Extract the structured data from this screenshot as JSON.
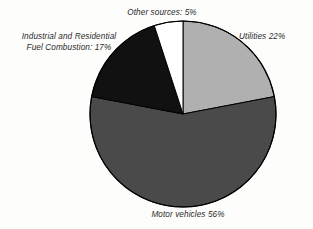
{
  "chart_data": {
    "type": "pie",
    "title": "",
    "legend_position": "none",
    "grid": false,
    "categories": [
      "Utilities",
      "Motor vehicles",
      "Industrial and Residential Fuel Combustion",
      "Other sources"
    ],
    "values": [
      22,
      56,
      17,
      5
    ],
    "unit": "%",
    "slices": [
      {
        "label": "Utilities 22%",
        "category": "Utilities",
        "value": 22,
        "color": "#b0b0b0",
        "start_angle_deg": 0,
        "end_angle_deg": 79.2,
        "label_position": "right"
      },
      {
        "label": "Motor vehicles 56%",
        "category": "Motor vehicles",
        "value": 56,
        "color": "#4a4a4a",
        "start_angle_deg": 79.2,
        "end_angle_deg": 280.8,
        "label_position": "bottom"
      },
      {
        "label": "Industrial and Residential\nFuel Combustion: 17%",
        "category": "Industrial and Residential Fuel Combustion",
        "value": 17,
        "color": "#111111",
        "start_angle_deg": 280.8,
        "end_angle_deg": 342.0,
        "label_position": "left"
      },
      {
        "label": "Other sources: 5%",
        "category": "Other sources",
        "value": 5,
        "color": "#ffffff",
        "start_angle_deg": 342.0,
        "end_angle_deg": 360.0,
        "label_position": "top"
      }
    ],
    "outline_color": "#000000"
  },
  "labels": {
    "other_sources": "Other sources: 5%",
    "utilities": "Utilities 22%",
    "industrial": "Industrial and Residential\nFuel Combustion: 17%",
    "motor_vehicles": "Motor vehicles 56%"
  },
  "geometry": {
    "center_x": 183,
    "center_y": 114,
    "radius": 93
  }
}
